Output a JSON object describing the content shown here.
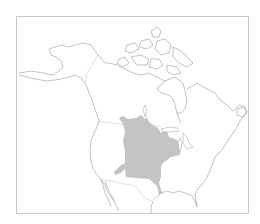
{
  "header": {
    "fragment_text": "· ·"
  },
  "map": {
    "type": "species-range-map",
    "region": "North America",
    "range_fill_color": "#c4c4c4",
    "outline_color": "#9a9a9a",
    "border_color": "#c4c4c4",
    "frame_color": "#c8c8c8",
    "range_description": "Central United States from the Great Plains east to the Great Lakes and Ohio Valley, south to Texas/Louisiana Gulf coast"
  }
}
